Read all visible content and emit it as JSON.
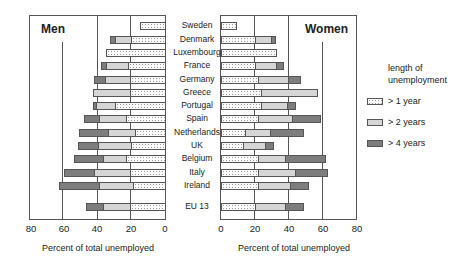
{
  "chart_data": [
    {
      "type": "bar",
      "orientation": "horizontal-stacked",
      "title": "Men",
      "xlabel": "Percent of total unemployed",
      "x_direction": "reversed",
      "xlim": [
        0,
        80
      ],
      "xticks": [
        "80",
        "60",
        "40",
        "20",
        "0"
      ],
      "categories": [
        "Sweden",
        "Denmark",
        "Luxembourg",
        "France",
        "Germany",
        "Greece",
        "Portugal",
        "Spain",
        "Netherlands",
        "UK",
        "Belgium",
        "Italy",
        "Ireland",
        "EU 13"
      ],
      "series": [
        {
          "name": "> 1 year",
          "values": [
            15,
            20,
            35,
            22,
            21,
            21,
            30,
            23,
            18,
            20,
            23,
            21,
            19,
            21
          ]
        },
        {
          "name": "> 2 years",
          "values": [
            0,
            10,
            0,
            13,
            15,
            22,
            11,
            16,
            16,
            20,
            14,
            21,
            20,
            16
          ]
        },
        {
          "name": "> 4 years",
          "values": [
            0,
            3,
            0,
            3,
            6,
            0,
            2,
            9,
            17,
            12,
            17,
            18,
            24,
            10
          ]
        }
      ],
      "grid": "vertical lines at 20, 40, 60"
    },
    {
      "type": "bar",
      "orientation": "horizontal-stacked",
      "title": "Women",
      "xlabel": "Percent of total unemployed",
      "xlim": [
        0,
        80
      ],
      "xticks": [
        "0",
        "20",
        "40",
        "60",
        "80"
      ],
      "categories": [
        "Sweden",
        "Denmark",
        "Luxembourg",
        "France",
        "Germany",
        "Greece",
        "Portugal",
        "Spain",
        "Netherlands",
        "UK",
        "Belgium",
        "Italy",
        "Ireland",
        "EU 13"
      ],
      "series": [
        {
          "name": "> 1 year",
          "values": [
            9,
            20,
            33,
            20,
            22,
            24,
            24,
            22,
            14,
            13,
            22,
            22,
            22,
            20
          ]
        },
        {
          "name": "> 2 years",
          "values": [
            0,
            10,
            0,
            13,
            18,
            33,
            15,
            20,
            15,
            13,
            16,
            22,
            19,
            18
          ]
        },
        {
          "name": "> 4 years",
          "values": [
            0,
            2,
            0,
            4,
            7,
            0,
            5,
            17,
            20,
            5,
            24,
            19,
            11,
            11
          ]
        }
      ],
      "grid": "vertical lines at 20, 40, 60"
    }
  ],
  "panels": {
    "men": {
      "title": "Men",
      "xlabel": "Percent of total unemployed",
      "ticks": [
        "80",
        "60",
        "40",
        "20",
        "0"
      ]
    },
    "women": {
      "title": "Women",
      "xlabel": "Percent of total unemployed",
      "ticks": [
        "0",
        "20",
        "40",
        "60",
        "80"
      ]
    }
  },
  "countries": [
    "Sweden",
    "Denmark",
    "Luxembourg",
    "France",
    "Germany",
    "Greece",
    "Portugal",
    "Spain",
    "Netherlands",
    "UK",
    "Belgium",
    "Italy",
    "Ireland",
    "EU 13"
  ],
  "legend": {
    "title_line1": "length of",
    "title_line2": "unemployment",
    "items": [
      "> 1 year",
      "> 2 years",
      "> 4 years"
    ]
  }
}
